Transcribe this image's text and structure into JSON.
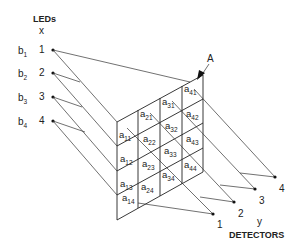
{
  "diagram": {
    "title_leds": "LEDs",
    "leds_axis": "x",
    "detectors_axis": "y",
    "title_detectors": "DETECTORS",
    "array_label": "A",
    "leds": [
      {
        "b_main": "b",
        "b_sub": "1",
        "num": "1"
      },
      {
        "b_main": "b",
        "b_sub": "2",
        "num": "2"
      },
      {
        "b_main": "b",
        "b_sub": "3",
        "num": "3"
      },
      {
        "b_main": "b",
        "b_sub": "4",
        "num": "4"
      }
    ],
    "detectors": [
      {
        "num": "1"
      },
      {
        "num": "2"
      },
      {
        "num": "3"
      },
      {
        "num": "4"
      }
    ],
    "cells": [
      {
        "main": "a",
        "sub": "11"
      },
      {
        "main": "a",
        "sub": "12"
      },
      {
        "main": "a",
        "sub": "13"
      },
      {
        "main": "a",
        "sub": "14"
      },
      {
        "main": "a",
        "sub": "21"
      },
      {
        "main": "a",
        "sub": "22"
      },
      {
        "main": "a",
        "sub": "23"
      },
      {
        "main": "a",
        "sub": "24"
      },
      {
        "main": "a",
        "sub": "31"
      },
      {
        "main": "a",
        "sub": "32"
      },
      {
        "main": "a",
        "sub": "33"
      },
      {
        "main": "a",
        "sub": "34"
      },
      {
        "main": "a",
        "sub": "41"
      },
      {
        "main": "a",
        "sub": "42"
      },
      {
        "main": "a",
        "sub": "43"
      },
      {
        "main": "a",
        "sub": "44"
      }
    ]
  }
}
